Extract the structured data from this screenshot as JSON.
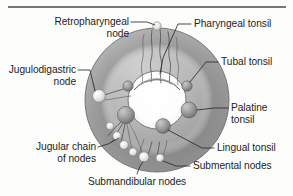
{
  "figure": {
    "top_rule": true,
    "background_color": "#fdfdfc",
    "ring_color_outer": "#b9b9b9",
    "ring_color_inner": "#8d8d8d",
    "node_color_pale": "#e8e8e6",
    "tonsil_color": "#9a9a9a",
    "lumen_color": "#ffffff",
    "label_color": "#1d1d1d",
    "leader_color": "#2b2b2b"
  },
  "labels": {
    "retropharyngeal_node": {
      "line1": "Retropharyngeal",
      "line2": "node"
    },
    "pharyngeal_tonsil": {
      "line1": "Pharyngeal tonsil"
    },
    "tubal_tonsil": {
      "line1": "Tubal tonsil"
    },
    "palatine_tonsil": {
      "line1": "Palatine",
      "line2": "tonsil"
    },
    "lingual_tonsil": {
      "line1": "Lingual tonsil"
    },
    "jugulodigastric_node": {
      "line1": "Jugulodigastric",
      "line2": "node"
    },
    "jugular_chain_of_nodes": {
      "line1": "Jugular chain",
      "line2": "of nodes"
    },
    "submandibular_nodes": {
      "line1": "Submandibular nodes"
    },
    "submental_nodes": {
      "line1": "Submental nodes"
    }
  },
  "structures": [
    {
      "name": "retropharyngeal-node",
      "type": "lymph-node",
      "shade": "pale",
      "cx": 157,
      "cy": 26,
      "r": 4.2
    },
    {
      "name": "pharyngeal-tonsil",
      "type": "tonsil-arc",
      "shade": "dark"
    },
    {
      "name": "tubal-tonsil-right",
      "type": "tonsil",
      "shade": "mid",
      "cx": 187,
      "cy": 86,
      "r": 5.2
    },
    {
      "name": "tubal-tonsil-left",
      "type": "tonsil",
      "shade": "mid",
      "cx": 128,
      "cy": 86,
      "r": 5.2
    },
    {
      "name": "palatine-tonsil-right",
      "type": "tonsil",
      "shade": "mid",
      "cx": 189,
      "cy": 110,
      "r": 8.0
    },
    {
      "name": "palatine-tonsil-left",
      "type": "tonsil",
      "shade": "mid",
      "cx": 126,
      "cy": 115,
      "r": 8.6
    },
    {
      "name": "lingual-tonsil",
      "type": "tonsil",
      "shade": "mid",
      "cx": 163,
      "cy": 126,
      "r": 7.4
    },
    {
      "name": "jugulodigastric-node",
      "type": "lymph-node",
      "shade": "pale",
      "cx": 99,
      "cy": 96,
      "r": 6.4
    },
    {
      "name": "jugular-chain-node-1",
      "type": "lymph-node",
      "shade": "pale",
      "cx": 110,
      "cy": 126,
      "r": 3.8
    },
    {
      "name": "jugular-chain-node-2",
      "type": "lymph-node",
      "shade": "pale",
      "cx": 117,
      "cy": 136,
      "r": 4.2
    },
    {
      "name": "jugular-chain-node-3",
      "type": "lymph-node",
      "shade": "pale",
      "cx": 124,
      "cy": 145,
      "r": 4.4
    },
    {
      "name": "jugular-chain-node-4",
      "type": "lymph-node",
      "shade": "pale",
      "cx": 133,
      "cy": 152,
      "r": 4.0
    },
    {
      "name": "submandibular-node-1",
      "type": "lymph-node",
      "shade": "pale",
      "cx": 144,
      "cy": 157,
      "r": 5.0
    },
    {
      "name": "submental-node-1",
      "type": "lymph-node",
      "shade": "pale",
      "cx": 160,
      "cy": 158,
      "r": 4.0
    }
  ]
}
